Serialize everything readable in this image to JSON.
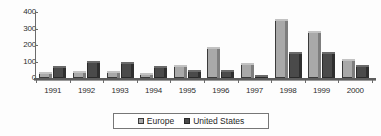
{
  "chart_data": {
    "type": "bar",
    "title": "",
    "subtitle": "",
    "xlabel": "",
    "ylabel": "",
    "categories": [
      "1991",
      "1992",
      "1993",
      "1994",
      "1995",
      "1996",
      "1997",
      "1998",
      "1999",
      "2000"
    ],
    "series": [
      {
        "name": "Europe",
        "color": "#a9a9a9",
        "values": [
          35,
          40,
          40,
          30,
          80,
          190,
          90,
          355,
          285,
          115
        ]
      },
      {
        "name": "United States",
        "color": "#4a4a4a",
        "values": [
          75,
          105,
          100,
          70,
          50,
          50,
          20,
          155,
          155,
          80
        ]
      }
    ],
    "ylim": [
      0,
      400
    ],
    "yticks": [
      0,
      100,
      200,
      300,
      400
    ],
    "ytick_labels": [
      "0",
      "100",
      "200",
      "300",
      "400"
    ],
    "grid": false,
    "legend_position": "bottom-center",
    "style": "3d-bar-grayscale"
  },
  "legend": {
    "entries": [
      {
        "label": "Europe",
        "swatch": "europe"
      },
      {
        "label": "United States",
        "swatch": "us"
      }
    ]
  }
}
